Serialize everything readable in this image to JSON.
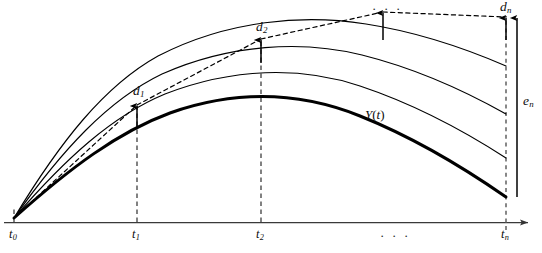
{
  "figure": {
    "background_color": "#ffffff",
    "ink_color": "#000000",
    "axis_color": "#333333"
  },
  "axis": {
    "name": "time-axis",
    "ticks": [
      {
        "id": "t0",
        "base": "t",
        "sub": "0",
        "x": 14
      },
      {
        "id": "t1",
        "base": "t",
        "sub": "1",
        "x": 137
      },
      {
        "id": "t2",
        "base": "t",
        "sub": "2",
        "x": 261
      },
      {
        "id": "tn",
        "base": "t",
        "sub": "n",
        "x": 506
      }
    ],
    "ellipsis": "· · ·",
    "ellipsis_x": 385,
    "arrow_head": true
  },
  "errors": {
    "local": [
      {
        "id": "d1",
        "base": "d",
        "sub": "1",
        "label_x": 133,
        "label_y": 90
      },
      {
        "id": "d2",
        "base": "d",
        "sub": "2",
        "label_x": 256,
        "label_y": 26
      },
      {
        "id": "dn",
        "base": "d",
        "sub": "n",
        "label_x": 502,
        "label_y": 2
      }
    ],
    "global": {
      "id": "en",
      "base": "e",
      "sub": "n",
      "label_x": 519,
      "label_y": 92
    },
    "top_ellipsis": "· · ·",
    "top_ellipsis_x": 375,
    "top_ellipsis_y": 4
  },
  "curves": {
    "solution_label": {
      "id": "Yt",
      "text": "Y",
      "paren_open": "(",
      "var": "t",
      "paren_close": ")",
      "x": 370,
      "y": 111
    },
    "count": 4,
    "styles": {
      "exact_solution": "thick-solid",
      "perturbed_solutions": "thin-solid",
      "extrapolation": "dashed"
    }
  },
  "legend_notes": {
    "d_meaning": "local truncation error at each step",
    "e_meaning": "accumulated global error at the final time"
  }
}
